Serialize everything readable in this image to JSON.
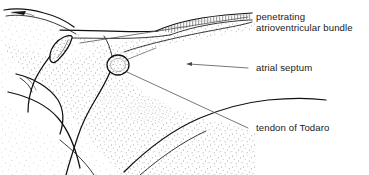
{
  "figure": {
    "background_color": "#ffffff",
    "ink_color": "#101010",
    "stipple_color": "#8a8a8a",
    "leader_color": "#4a4a4a",
    "width": 369,
    "height": 175
  },
  "labels": [
    {
      "name": "penetrating-atrioventricular-bundle",
      "line1": "penetrating",
      "line2": "atrioventricular bundle",
      "text_x": 256,
      "line1_y": 20,
      "line2_y": 31,
      "leader": {
        "start_x": 248,
        "start_y": 17,
        "end_x": 80,
        "end_y": 43
      }
    },
    {
      "name": "atrial-septum",
      "line1": "atrial septum",
      "line2": "",
      "text_x": 256,
      "line1_y": 71,
      "line2_y": 71,
      "leader": {
        "start_x": 248,
        "start_y": 68,
        "end_x": 187,
        "end_y": 64
      }
    },
    {
      "name": "tendon-of-todaro",
      "line1": "tendon of Todaro",
      "line2": "",
      "text_x": 256,
      "line1_y": 131,
      "line2_y": 131,
      "leader": {
        "start_x": 248,
        "start_y": 128,
        "end_x": 126,
        "end_y": 72
      }
    }
  ],
  "structures": [
    {
      "name": "atrioventricular-node-oval",
      "center_x": 118,
      "center_y": 65
    },
    {
      "name": "teardrop-structure",
      "center_x": 62,
      "center_y": 50
    },
    {
      "name": "penetrating-bundle-band",
      "center_x": 215,
      "center_y": 22
    },
    {
      "name": "septal-stipple-field",
      "center_x": 150,
      "center_y": 110
    },
    {
      "name": "valve-leaflet-cleft",
      "center_x": 60,
      "center_y": 120
    },
    {
      "name": "pointed-wedge-tip",
      "center_x": 25,
      "center_y": 14
    }
  ]
}
